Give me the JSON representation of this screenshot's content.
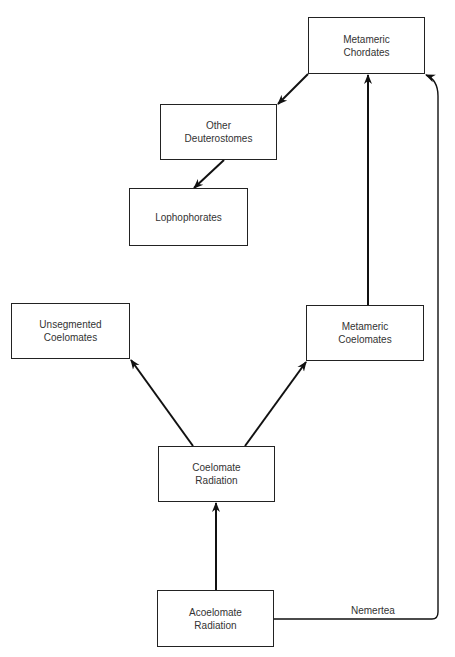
{
  "diagram": {
    "type": "flow",
    "nodes": [
      {
        "id": "metameric-chordates",
        "label": "Metameric\nChordates",
        "x": 308,
        "y": 17,
        "w": 117,
        "h": 57
      },
      {
        "id": "other-deuterostomes",
        "label": "Other\nDeuterostomes",
        "x": 160,
        "y": 104,
        "w": 117,
        "h": 56
      },
      {
        "id": "lophophorates",
        "label": "Lophophorates",
        "x": 129,
        "y": 188,
        "w": 119,
        "h": 58
      },
      {
        "id": "unsegmented-coelomates",
        "label": "Unsegmented\nCoelomates",
        "x": 11,
        "y": 303,
        "w": 119,
        "h": 56
      },
      {
        "id": "metameric-coelomates",
        "label": "Metameric\nCoelomates",
        "x": 306,
        "y": 305,
        "w": 118,
        "h": 56
      },
      {
        "id": "coelomate-radiation",
        "label": "Coelomate\nRadiation",
        "x": 158,
        "y": 446,
        "w": 117,
        "h": 56
      },
      {
        "id": "acoelomate-radiation",
        "label": "Acoelomate\nRadiation",
        "x": 157,
        "y": 590,
        "w": 117,
        "h": 57
      }
    ],
    "edges": [
      {
        "from": "acoelomate-radiation",
        "to": "coelomate-radiation"
      },
      {
        "from": "coelomate-radiation",
        "to": "unsegmented-coelomates"
      },
      {
        "from": "coelomate-radiation",
        "to": "metameric-coelomates"
      },
      {
        "from": "metameric-coelomates",
        "to": "metameric-chordates"
      },
      {
        "from": "metameric-chordates",
        "to": "other-deuterostomes"
      },
      {
        "from": "other-deuterostomes",
        "to": "lophophorates"
      },
      {
        "from": "acoelomate-radiation",
        "to": "metameric-chordates",
        "label": "Nemertea"
      }
    ],
    "edge_label_nemertea": "Nemertea"
  }
}
